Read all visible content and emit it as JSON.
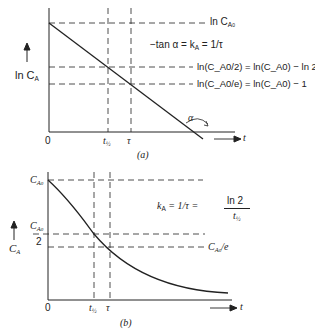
{
  "panel_a": {
    "caption": "(a)",
    "y_label": "ln C",
    "y_label_sub": "A",
    "x_label": "t",
    "origin": "0",
    "tick_t_half": "t",
    "tick_t_half_sub": "½",
    "tick_tau": "τ",
    "line_top_label": "ln C",
    "line_top_sub": "A",
    "line_top_subsub": "0",
    "slope_label": "−tan α = k",
    "slope_label_sub": "A",
    "slope_label_tail": " = 1/τ",
    "half_label": "ln(C_A0/2) = ln(C_A0) − ln 2",
    "e_label": "ln(C_A0/e) = ln(C_A0) − 1",
    "angle_label": "α"
  },
  "panel_b": {
    "caption": "(b)",
    "y_label": "C",
    "y_label_sub": "A",
    "x_label": "t",
    "origin": "0",
    "tick_t_half": "t",
    "tick_t_half_sub": "½",
    "tick_tau": "τ",
    "top_label": "C",
    "top_sub": "A",
    "top_subsub": "0",
    "half_num": "C",
    "half_num_sub": "A",
    "half_num_subsub": "0",
    "half_den": "2",
    "e_label_main": "C",
    "e_label_sub": "A",
    "e_label_subsub": "0",
    "e_label_tail": "/e",
    "rate_label": "k",
    "rate_label_sub": "A",
    "rate_label_mid": " = 1/τ = ",
    "rate_num": "ln 2",
    "rate_den": "t",
    "rate_den_sub": "½"
  }
}
